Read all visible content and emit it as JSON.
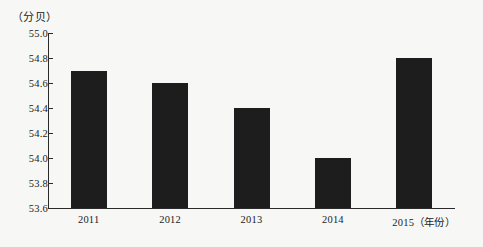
{
  "chart_data": {
    "type": "bar",
    "title": "",
    "subtitle": "",
    "xlabel": "（年份）",
    "ylabel": "（分贝）",
    "categories": [
      "2011",
      "2012",
      "2013",
      "2014",
      "2015"
    ],
    "values": [
      54.7,
      54.6,
      54.4,
      54.0,
      54.8
    ],
    "series": [
      {
        "name": "",
        "values": [
          54.7,
          54.6,
          54.4,
          54.0,
          54.8
        ]
      }
    ],
    "ylim": [
      53.6,
      55.0
    ],
    "ytick_step": 0.2,
    "ytick_labels": [
      "55.0",
      "54.8",
      "54.6",
      "54.4",
      "54.2",
      "54.0",
      "53.8",
      "53.6"
    ],
    "ytick_values": [
      55.0,
      54.8,
      54.6,
      54.4,
      54.2,
      54.0,
      53.8,
      53.6
    ],
    "grid": false,
    "legend": null,
    "legend_position": "none",
    "bar_color": "#1d1d1d",
    "axis_color": "#2a2a2a",
    "background_color": "#f7f7f5"
  },
  "axes": {
    "y_unit_caption": "（分贝）",
    "x_unit_caption": "（年份）"
  }
}
